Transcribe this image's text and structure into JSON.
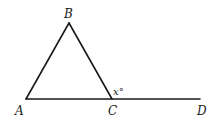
{
  "diagram": {
    "type": "geometry-triangle-exterior-angle",
    "points": {
      "A": {
        "label": "A",
        "x": 26,
        "y": 99
      },
      "B": {
        "label": "B",
        "x": 69,
        "y": 23
      },
      "C": {
        "label": "C",
        "x": 112,
        "y": 99
      },
      "D": {
        "label": "D",
        "x": 200,
        "y": 99
      }
    },
    "segments": [
      {
        "from": "A",
        "to": "B"
      },
      {
        "from": "B",
        "to": "C"
      },
      {
        "from": "A",
        "to": "D"
      }
    ],
    "angle_label": {
      "text": "x°",
      "at": "C",
      "between": [
        "B",
        "C",
        "D"
      ]
    },
    "colors": {
      "stroke": "#1a1a1a",
      "background": "#ffffff"
    }
  }
}
